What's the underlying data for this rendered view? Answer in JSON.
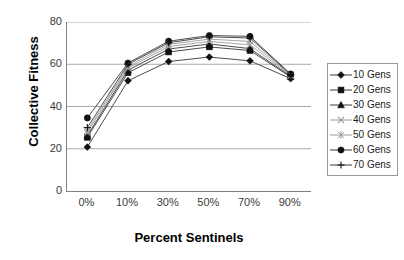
{
  "chart_data": {
    "type": "line",
    "title": "",
    "xlabel": "Percent Sentinels",
    "ylabel": "Collective Fitness",
    "categories": [
      "0%",
      "10%",
      "30%",
      "50%",
      "70%",
      "90%"
    ],
    "ylim": [
      0,
      80
    ],
    "yticks": [
      0,
      20,
      40,
      60,
      80
    ],
    "grid": true,
    "legend_position": "right",
    "series": [
      {
        "name": "10 Gens",
        "marker": "diamond",
        "values": [
          20.8,
          52.2,
          61.3,
          63.4,
          61.6,
          53.2
        ]
      },
      {
        "name": "20 Gens",
        "marker": "square",
        "values": [
          25.4,
          56.0,
          65.8,
          68.2,
          66.5,
          54.0
        ]
      },
      {
        "name": "30 Gens",
        "marker": "triangle",
        "values": [
          26.2,
          57.2,
          67.2,
          69.6,
          67.4,
          54.3
        ]
      },
      {
        "name": "40 Gens",
        "marker": "x-cross",
        "values": [
          27.6,
          58.2,
          68.4,
          70.8,
          69.2,
          54.6
        ]
      },
      {
        "name": "50 Gens",
        "marker": "star",
        "values": [
          28.6,
          59.0,
          69.4,
          71.9,
          70.8,
          54.9
        ]
      },
      {
        "name": "60 Gens",
        "marker": "circle",
        "values": [
          34.6,
          60.6,
          70.9,
          73.6,
          73.2,
          55.4
        ]
      },
      {
        "name": "70 Gens",
        "marker": "plus",
        "values": [
          30.0,
          60.0,
          70.2,
          73.0,
          72.4,
          55.1
        ]
      }
    ]
  },
  "axis": {
    "y_title": "Collective Fitness",
    "x_title": "Percent Sentinels",
    "y_tick_labels": [
      "80",
      "60",
      "40",
      "20",
      "0"
    ],
    "x_tick_labels": [
      "0%",
      "10%",
      "30%",
      "50%",
      "70%",
      "90%"
    ]
  },
  "legend": {
    "items": [
      {
        "label": "10 Gens",
        "marker": "diamond-marker-icon"
      },
      {
        "label": "20 Gens",
        "marker": "square-marker-icon"
      },
      {
        "label": "30 Gens",
        "marker": "triangle-marker-icon"
      },
      {
        "label": "40 Gens",
        "marker": "x-cross-marker-icon"
      },
      {
        "label": "50 Gens",
        "marker": "star-marker-icon"
      },
      {
        "label": "60 Gens",
        "marker": "circle-marker-icon"
      },
      {
        "label": "70 Gens",
        "marker": "plus-marker-icon"
      }
    ]
  },
  "colors": {
    "series_line": "#4d4d4d",
    "marker_dark": "#111111",
    "marker_light": "#9a9a9a",
    "gridline": "#a8a8a8",
    "axis": "#808080",
    "text": "#000000"
  }
}
